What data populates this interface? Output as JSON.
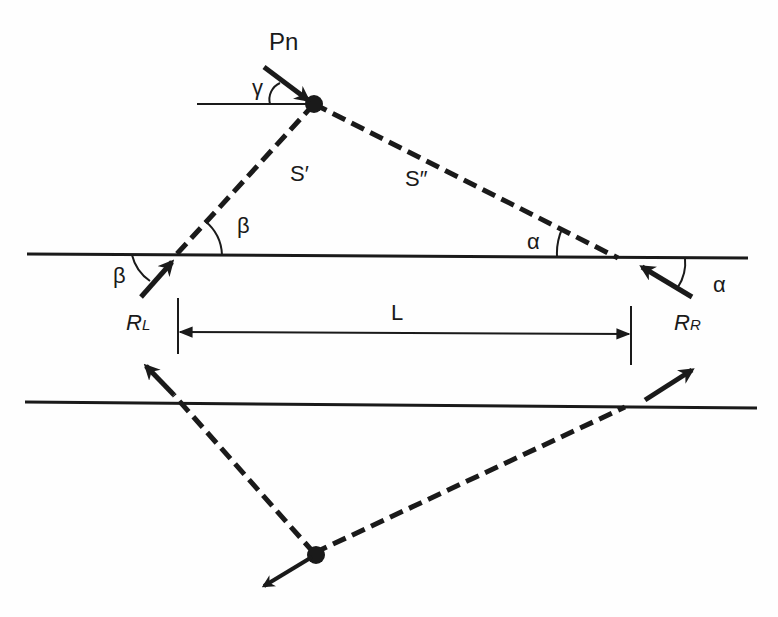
{
  "diagram": {
    "colors": {
      "stroke": "#1a1a1a",
      "background": "#fefefe"
    },
    "labels": {
      "force": "Pn",
      "gamma": "γ",
      "s_prime": "S′",
      "s_double_prime": "S″",
      "beta_upper": "β",
      "beta_left": "β",
      "alpha_upper": "α",
      "alpha_right": "α",
      "reaction_left_main": "R",
      "reaction_left_sub": "L",
      "reaction_right_main": "R",
      "reaction_right_sub": "R",
      "span": "L"
    },
    "elements": [
      "upper-beam-line",
      "lower-beam-line",
      "strut-s-prime",
      "strut-s-double-prime",
      "load-arrow-pn",
      "reaction-arrow-left",
      "reaction-arrow-right",
      "dimension-line-L",
      "lower-left-dashed-strut",
      "lower-right-dashed-strut",
      "lower-node-arrow"
    ]
  }
}
